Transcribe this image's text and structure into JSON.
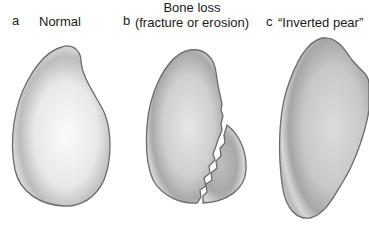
{
  "panels": [
    {
      "letter": "a",
      "title": "Normal"
    },
    {
      "letter": "b",
      "title_line1": "Bone loss",
      "title_line2": "(fracture or erosion)"
    },
    {
      "letter": "c",
      "title": "“Inverted pear”"
    }
  ],
  "colors": {
    "outline": "#6b6b6b",
    "fill_light": "#f4f4f4",
    "fill_mid": "#d6d6d6",
    "fill_dark": "#a9a9a9",
    "text": "#1a1a1a",
    "background": "#ffffff"
  }
}
